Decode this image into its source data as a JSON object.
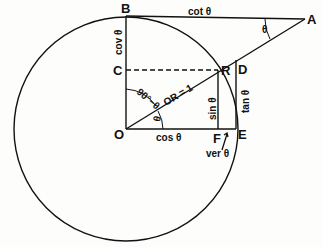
{
  "diagram": {
    "points": {
      "O": "O",
      "B": "B",
      "A": "A",
      "C": "C",
      "R": "R",
      "D": "D",
      "E": "E",
      "F": "F"
    },
    "labels": {
      "cot": "cot θ",
      "cov": "cov θ",
      "tan": "tan θ",
      "sin": "sin θ",
      "cos": "cos θ",
      "ver": "ver θ",
      "radius": "OR = 1",
      "complement": "90°−θ",
      "theta_at_O": "θ",
      "theta_at_A": "θ"
    },
    "colors": {
      "line": "#111111",
      "background": "#fdfdfb"
    }
  }
}
